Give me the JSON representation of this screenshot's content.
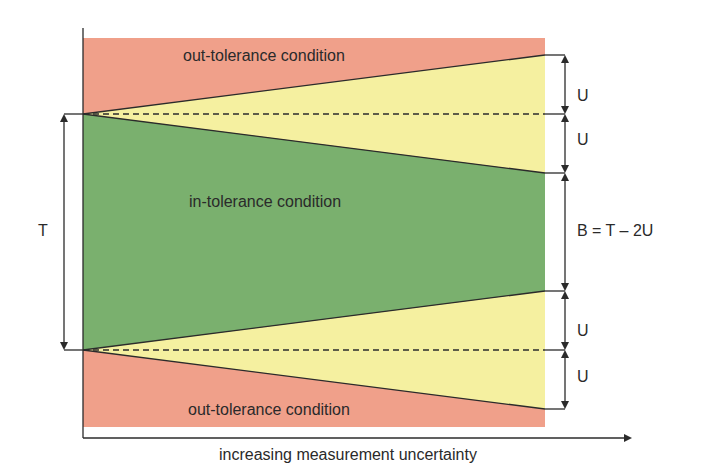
{
  "diagram": {
    "regions": {
      "top_out": "out-tolerance condition",
      "in": "in-tolerance condition",
      "bottom_out": "out-tolerance condition"
    },
    "left_label": "T",
    "right_labels": [
      "U",
      "U",
      "B = T – 2U",
      "U",
      "U"
    ],
    "x_axis_label": "increasing measurement uncertainty",
    "colors": {
      "out_tolerance": "#f0a08a",
      "guard_band": "#f5f0a0",
      "in_tolerance": "#7ab06e",
      "line": "#2b2b2b"
    }
  }
}
